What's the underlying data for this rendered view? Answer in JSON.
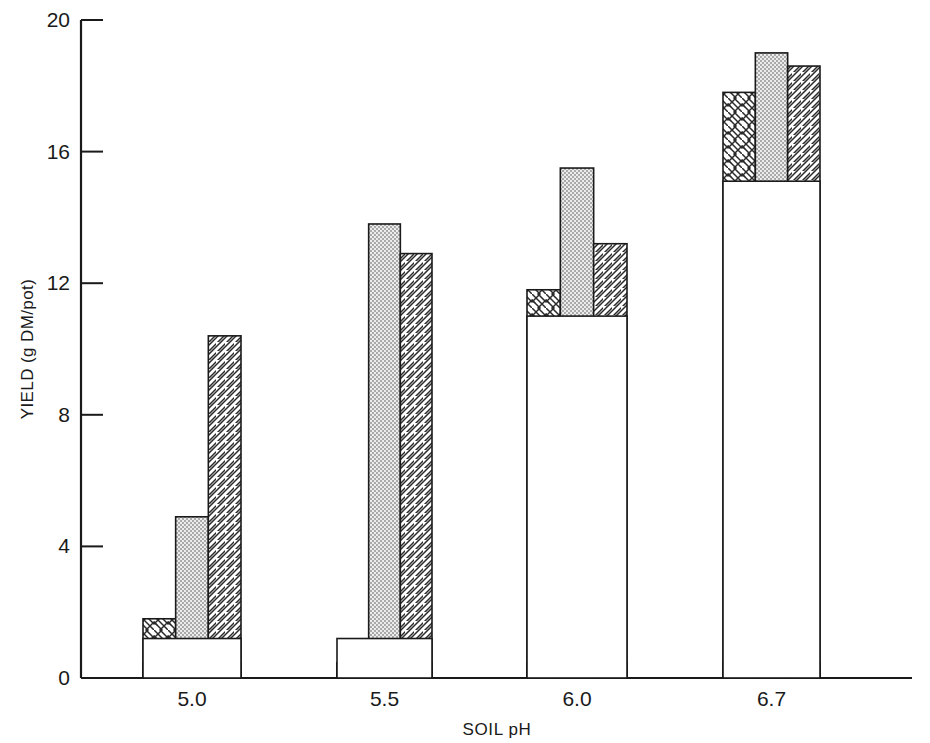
{
  "chart_data": {
    "type": "bar",
    "title": "",
    "xlabel": "SOIL pH",
    "ylabel": "YIELD (g DM/pot)",
    "categories": [
      "5.0",
      "5.5",
      "6.0",
      "6.7"
    ],
    "xtick_labels": [
      "5.0",
      "5.5",
      "6.0",
      "6.7"
    ],
    "ytick_labels": [
      "0",
      "4",
      "8",
      "12",
      "16",
      "20"
    ],
    "ytick_values": [
      0,
      4,
      8,
      12,
      16,
      20
    ],
    "ylim": [
      0,
      20
    ],
    "grid": false,
    "legend": "none",
    "series": [
      {
        "name": "base",
        "pattern": "solid-white",
        "values": [
          1.2,
          1.2,
          11.0,
          15.1
        ]
      },
      {
        "name": "cross-hatch",
        "pattern": "cross-hatch",
        "values": [
          1.8,
          null,
          11.8,
          17.8
        ]
      },
      {
        "name": "stipple",
        "pattern": "dotted",
        "values": [
          4.9,
          13.8,
          15.5,
          19.0
        ]
      },
      {
        "name": "diagonal-hatch",
        "pattern": "diagonal-hatch",
        "values": [
          10.4,
          12.9,
          13.2,
          18.6
        ]
      }
    ],
    "colors": {
      "axis": "#1a1a1a",
      "bar_outline": "#1a1a1a",
      "base_fill": "#ffffff",
      "stipple_fill": "#e2e2e2",
      "hatch_fill": "#ffffff",
      "cross_fill": "#ffffff"
    }
  }
}
